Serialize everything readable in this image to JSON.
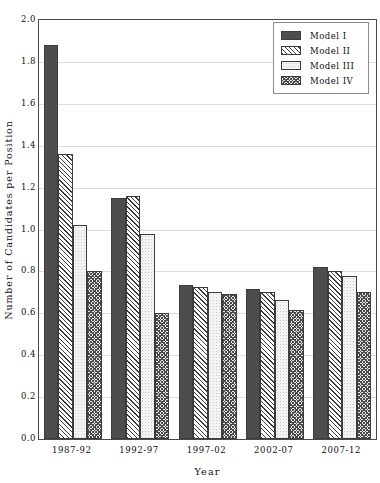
{
  "chart_data": {
    "type": "bar",
    "title": "",
    "xlabel": "Year",
    "ylabel": "Number of Candidates per Position",
    "categories": [
      "1987-92",
      "1992-97",
      "1997-02",
      "2002-07",
      "2007-12"
    ],
    "series": [
      {
        "name": "Model I",
        "values": [
          1.88,
          1.15,
          0.735,
          0.715,
          0.82
        ],
        "pattern": "solid-dark-gray",
        "color": "#4d4d4d"
      },
      {
        "name": "Model II",
        "values": [
          1.36,
          1.16,
          0.725,
          0.7,
          0.8
        ],
        "pattern": "diagonal-hatch",
        "color": "#3f3f3f"
      },
      {
        "name": "Model III",
        "values": [
          1.02,
          0.98,
          0.7,
          0.665,
          0.78
        ],
        "pattern": "light-dotted",
        "color": "#f4f4f4"
      },
      {
        "name": "Model IV",
        "values": [
          0.8,
          0.6,
          0.69,
          0.615,
          0.7
        ],
        "pattern": "dense-checkerboard",
        "color": "#4a4a4a"
      }
    ],
    "ylim": [
      0.0,
      2.0
    ],
    "ytick_labels": [
      "0.0",
      "0.2",
      "0.4",
      "0.6",
      "0.8",
      "1.0",
      "1.2",
      "1.4",
      "1.6",
      "1.8",
      "2.0"
    ],
    "ytick_values": [
      0.0,
      0.2,
      0.4,
      0.6,
      0.8,
      1.0,
      1.2,
      1.4,
      1.6,
      1.8,
      2.0
    ],
    "grid": true,
    "grid_axis": "y",
    "legend_position": "top-right",
    "frame_color": "#4a4a4a",
    "grid_color": "#dcdcdc",
    "background": "#ffffff"
  },
  "legend": {
    "entries": [
      {
        "label": "Model I"
      },
      {
        "label": "Model II"
      },
      {
        "label": "Model III"
      },
      {
        "label": "Model IV"
      }
    ]
  }
}
